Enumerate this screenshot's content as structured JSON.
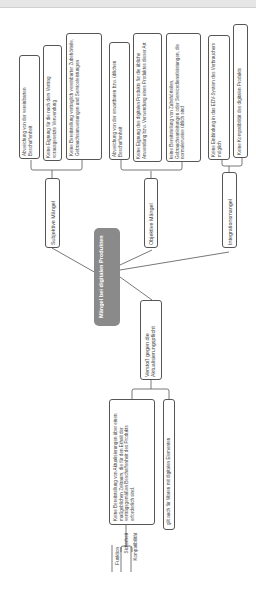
{
  "diagram": {
    "central_node": "Mängel bei digitalen Produkten",
    "branches": [
      {
        "label": "Subjektive Mängel",
        "items": [
          "Abweichung von der vereinbarten Beschaffenheit",
          "Keine Eignung für die nach dem Vertrag vorausgesetzte Verwendung",
          "Keine Bereitstellung vertraglich vereinbarter Zubehörteile, Gebrauchsanweisungen und Serviceleistungen"
        ]
      },
      {
        "label": "Objektive Mängel",
        "items": [
          "Abweichung von der erwartbaren bzw. üblichen Beschaffenheit",
          "Keine Eignung des digitalen Produkts für die übliche Anwendung bzw. Verwendung eines Produktes dieser Art",
          "keine Bereitstellung von Zubehörteilen, Gebrauchsanleitungen oder Servicedienstleistungen, die normalerweise üblich sind"
        ]
      },
      {
        "label": "Integrationsmangel",
        "items": [
          "Keine Einbindung in das EDV-System des Verbrauchers möglich",
          "Keine Kompatibilität des digitalen Produkts"
        ]
      },
      {
        "label": "Verstoß gegen die Aktualisierungspflicht",
        "items": [
          "Keine Bereitstellung von Aktualisierungen über einen maßgeblichen Zeitraum, die für den Erhalt der vertragsgemäßen Beschaffenheit des Produkts erforderlich sind.",
          "gilt auch für Waren mit digitalen Elementen"
        ],
        "sub_list": [
          "Funktion",
          "Sicherheit",
          "Kompatibilität"
        ]
      }
    ]
  }
}
